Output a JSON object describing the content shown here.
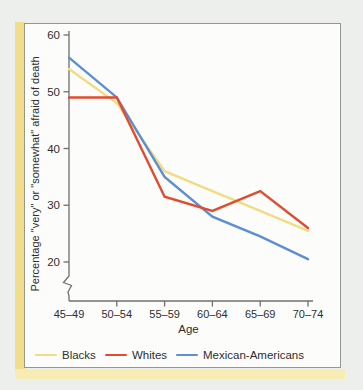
{
  "chart_data": {
    "type": "line",
    "title": "",
    "categories": [
      "45–49",
      "50–54",
      "55–59",
      "60–64",
      "65–69",
      "70–74"
    ],
    "series": [
      {
        "name": "Blacks",
        "color": "#f0dc82",
        "values": [
          54,
          48,
          36,
          32.5,
          29,
          25.5
        ]
      },
      {
        "name": "Whites",
        "color": "#e04c31",
        "values": [
          49,
          49,
          31.5,
          29,
          32.5,
          26
        ]
      },
      {
        "name": "Mexican-Americans",
        "color": "#5c8ed3",
        "values": [
          56,
          49,
          35,
          28,
          24.5,
          20.5
        ]
      }
    ],
    "xlabel": "Age",
    "ylabel": "Percentage \"very\" or \"somewhat\" afraid of death",
    "y_ticks": [
      60,
      50,
      40,
      30,
      20
    ],
    "ylim": [
      20,
      60
    ],
    "y_axis_break": true,
    "grid": false,
    "legend_position": "bottom"
  },
  "colors": {
    "accent_yellow": "#f2dd8a",
    "figure_background": "#fcfdfb",
    "box_border": "#8f9894",
    "axis": "#6f6f6f",
    "text": "#2e2e2e",
    "page_background": "#edefec"
  }
}
